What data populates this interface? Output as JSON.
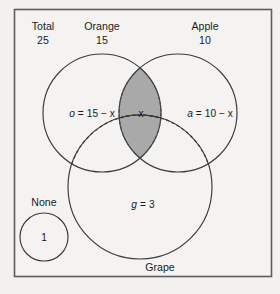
{
  "diagram": {
    "type": "venn-diagram",
    "frame": {
      "border_color": "#5d5d5d",
      "background": "#f4f3f1"
    },
    "shade_color": "#a9a9a9",
    "line_color": "#3a3a3a",
    "header": {
      "total": {
        "label": "Total",
        "value": "25"
      },
      "orange": {
        "label": "Orange",
        "value": "15"
      },
      "apple": {
        "label": "Apple",
        "value": "10"
      }
    },
    "sets": [
      {
        "name": "Orange",
        "count": "15",
        "region_label": "o = 15 − x"
      },
      {
        "name": "Apple",
        "count": "10",
        "region_label": "a = 10 − x"
      },
      {
        "name": "Grape",
        "count": "3",
        "region_label": "g = 3"
      }
    ],
    "regions": {
      "orange_only": {
        "var": "o",
        "equals": "=",
        "expr": "15 − x",
        "text": "o = 15 − x"
      },
      "apple_only": {
        "var": "a",
        "equals": "=",
        "expr": "10 − x",
        "text": "a = 10 − x"
      },
      "grape_only": {
        "var": "g",
        "equals": "=",
        "expr": "3",
        "text": "g = 3"
      },
      "orange_apple_intersection": {
        "var": "x",
        "text": "x",
        "shaded": "true"
      },
      "none": {
        "label": "None",
        "value": "1"
      }
    },
    "set_name_bottom": "Grape"
  }
}
